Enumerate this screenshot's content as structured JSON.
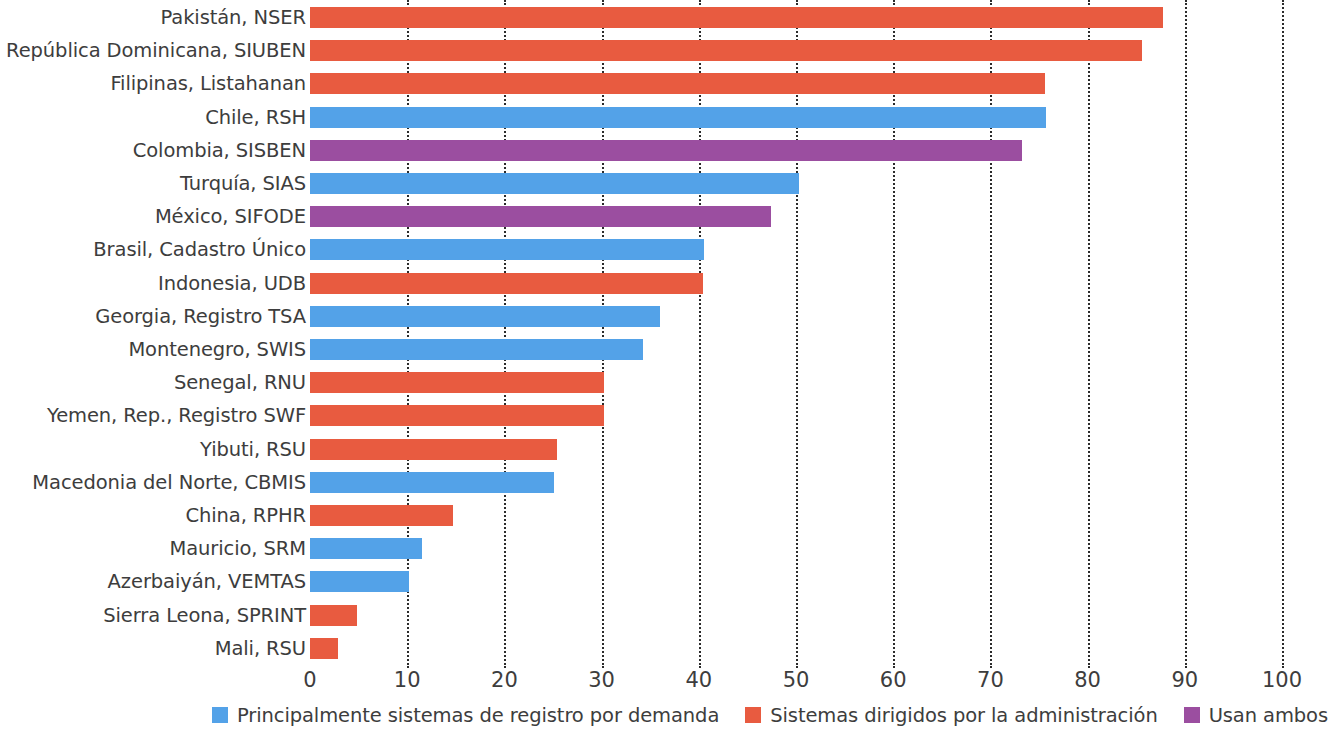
{
  "chart_data": {
    "type": "bar",
    "orientation": "horizontal",
    "title": "",
    "xlabel": "",
    "ylabel": "",
    "xlim": [
      0,
      100
    ],
    "xticks": [
      0,
      10,
      20,
      30,
      40,
      50,
      60,
      70,
      80,
      90,
      100
    ],
    "grid": "vertical-dotted",
    "legend_position": "bottom-right",
    "categories": [
      "Pakistán, NSER",
      "República Dominicana, SIUBEN",
      "Filipinas, Listahanan",
      "Chile, RSH",
      "Colombia, SISBEN",
      "Turquía, SIAS",
      "México, SIFODE",
      "Brasil, Cadastro Único",
      "Indonesia, UDB",
      "Georgia, Registro TSA",
      "Montenegro, SWIS",
      "Senegal, RNU",
      "Yemen, Rep., Registro SWF",
      "Yibuti, RSU",
      "Macedonia del Norte, CBMIS",
      "China, RPHR",
      "Mauricio, SRM",
      "Azerbaiyán, VEMTAS",
      "Sierra Leona, SPRINT",
      "Mali, RSU"
    ],
    "values": [
      87.8,
      85.6,
      75.6,
      75.7,
      73.2,
      50.3,
      47.4,
      40.5,
      40.4,
      36.0,
      34.3,
      30.2,
      30.2,
      25.4,
      25.1,
      14.7,
      11.5,
      10.2,
      4.8,
      2.9
    ],
    "groups": [
      "administered",
      "administered",
      "administered",
      "on-demand",
      "both",
      "on-demand",
      "both",
      "on-demand",
      "administered",
      "on-demand",
      "on-demand",
      "administered",
      "administered",
      "administered",
      "on-demand",
      "administered",
      "on-demand",
      "on-demand",
      "administered",
      "administered"
    ],
    "series": [
      {
        "name": "Principalmente sistemas de registro por demanda",
        "key": "on-demand",
        "color": "#53A2E8"
      },
      {
        "name": "Sistemas dirigidos por la administración",
        "key": "administered",
        "color": "#E85B40"
      },
      {
        "name": "Usan ambos",
        "key": "both",
        "color": "#9B4EA0"
      }
    ]
  },
  "axis": {
    "tick_labels": [
      "0",
      "10",
      "20",
      "30",
      "40",
      "50",
      "60",
      "70",
      "80",
      "90",
      "100"
    ]
  },
  "legend": {
    "items": [
      {
        "label": "Principalmente sistemas de registro por demanda",
        "color": "#53A2E8"
      },
      {
        "label": "Sistemas dirigidos por la administración",
        "color": "#E85B40"
      },
      {
        "label": "Usan ambos",
        "color": "#9B4EA0"
      }
    ]
  },
  "colors": {
    "on_demand": "#53A2E8",
    "administered": "#E85B40",
    "both": "#9B4EA0",
    "grid": "#2b2b2b",
    "text": "#3d3d3d",
    "background": "#ffffff"
  }
}
